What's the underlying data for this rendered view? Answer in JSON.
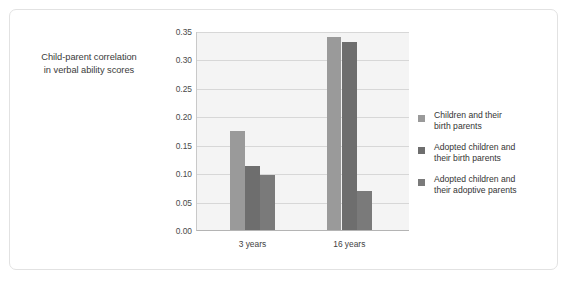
{
  "chart_data": {
    "type": "bar",
    "title": "",
    "subtitle": "",
    "xlabel": "",
    "ylabel": "Child-parent correlation in verbal ability scores",
    "ylabel_lines": [
      "Child-parent correlation",
      "in verbal ability scores"
    ],
    "categories": [
      "3 years",
      "16 years"
    ],
    "series": [
      {
        "name": "Children and their birth parents",
        "name_lines": [
          "Children and their",
          "birth parents"
        ],
        "color": "#9a9a9a",
        "values": [
          0.175,
          0.34
        ]
      },
      {
        "name": "Adopted children and their birth parents",
        "name_lines": [
          "Adopted children and",
          "their birth parents"
        ],
        "color": "#6e6e6e",
        "values": [
          0.112,
          0.33
        ]
      },
      {
        "name": "Adopted children and their adoptive parents",
        "name_lines": [
          "Adopted children and",
          "their adoptive parents"
        ],
        "color": "#7a7a7a",
        "values": [
          0.097,
          0.068
        ]
      }
    ],
    "ylim": [
      0.0,
      0.35
    ],
    "ytick_step": 0.05,
    "yticks": [
      "0.00",
      "0.05",
      "0.10",
      "0.15",
      "0.20",
      "0.25",
      "0.30",
      "0.35"
    ],
    "ytick_values": [
      0.0,
      0.05,
      0.1,
      0.15,
      0.2,
      0.25,
      0.3,
      0.35
    ],
    "grid": true,
    "legend_position": "right",
    "plot_background": "#f4f4f4",
    "gridline_color": "#d7d7d7",
    "axis_color": "#b4b4b4",
    "frame_color": "#e2e2e2"
  }
}
